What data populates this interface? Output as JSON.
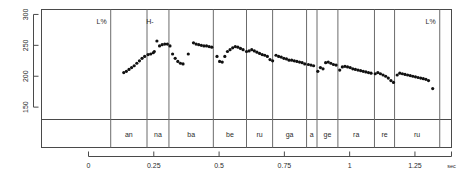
{
  "chart_data": {
    "type": "scatter",
    "title": "",
    "subtitle": "",
    "xlabel": "sec",
    "ylabel": "",
    "xlim": [
      -0.18,
      1.39
    ],
    "ylim": [
      130,
      308
    ],
    "grid": false,
    "legend": null,
    "xticks": [
      0,
      0.25,
      0.5,
      0.75,
      1,
      1.25
    ],
    "xticklabels": [
      "0",
      "0.25",
      "0.5",
      "0.75",
      "1",
      "1.25"
    ],
    "yticks": [
      150,
      200,
      250,
      300
    ],
    "yticklabels": [
      "150",
      "200",
      "250",
      "300"
    ],
    "x_unit_label": "sec",
    "series": [
      {
        "name": "f0",
        "x": [
          0.135,
          0.145,
          0.155,
          0.165,
          0.175,
          0.185,
          0.195,
          0.205,
          0.215,
          0.228,
          0.238,
          0.248,
          0.252,
          0.262,
          0.272,
          0.282,
          0.292,
          0.302,
          0.312,
          0.322,
          0.332,
          0.342,
          0.352,
          0.362,
          0.382,
          0.402,
          0.412,
          0.422,
          0.432,
          0.442,
          0.452,
          0.462,
          0.472,
          0.492,
          0.502,
          0.512,
          0.522,
          0.532,
          0.542,
          0.552,
          0.562,
          0.572,
          0.582,
          0.592,
          0.605,
          0.615,
          0.625,
          0.635,
          0.645,
          0.655,
          0.665,
          0.675,
          0.685,
          0.695,
          0.705,
          0.718,
          0.728,
          0.738,
          0.748,
          0.758,
          0.768,
          0.778,
          0.788,
          0.798,
          0.808,
          0.818,
          0.828,
          0.842,
          0.852,
          0.862,
          0.878,
          0.888,
          0.898,
          0.908,
          0.918,
          0.928,
          0.938,
          0.948,
          0.962,
          0.972,
          0.982,
          0.992,
          1.002,
          1.012,
          1.022,
          1.032,
          1.042,
          1.052,
          1.062,
          1.072,
          1.082,
          1.098,
          1.108,
          1.118,
          1.128,
          1.138,
          1.148,
          1.158,
          1.168,
          1.182,
          1.192,
          1.202,
          1.212,
          1.222,
          1.232,
          1.242,
          1.252,
          1.262,
          1.272,
          1.282,
          1.292,
          1.302,
          1.318
        ],
        "y": [
          206,
          208,
          211,
          214,
          217,
          221,
          225,
          229,
          232,
          235,
          236,
          238,
          240,
          257,
          249,
          251,
          252,
          252,
          249,
          236,
          229,
          224,
          221,
          220,
          236,
          254,
          252,
          251,
          250,
          249,
          249,
          248,
          247,
          232,
          224,
          223,
          232,
          240,
          243,
          246,
          248,
          247,
          245,
          243,
          240,
          241,
          243,
          241,
          239,
          237,
          235,
          234,
          232,
          227,
          225,
          234,
          232,
          231,
          229,
          228,
          226,
          226,
          225,
          224,
          223,
          222,
          220,
          219,
          218,
          217,
          208,
          214,
          212,
          222,
          223,
          221,
          219,
          218,
          210,
          215,
          216,
          215,
          214,
          212,
          211,
          210,
          209,
          208,
          207,
          206,
          205,
          204,
          206,
          204,
          202,
          200,
          197,
          193,
          190,
          202,
          205,
          204,
          203,
          202,
          201,
          200,
          199,
          198,
          197,
          196,
          195,
          193,
          180
        ]
      }
    ],
    "vertical_boundaries": [
      0.085,
      0.224,
      0.308,
      0.478,
      0.605,
      0.705,
      0.835,
      0.875,
      0.955,
      1.095,
      1.172,
      1.345
    ],
    "segment_labels": [
      "an",
      "na",
      "ba",
      "be",
      "ru",
      "ga",
      "a",
      "ge",
      "ra",
      "re",
      "ru"
    ],
    "tone_annotations": [
      {
        "label": "L%",
        "x": 0.085
      },
      {
        "label": "H-",
        "x": 0.265
      },
      {
        "label": "L%",
        "x": 1.345
      }
    ]
  },
  "plot": {
    "unit": "sec"
  }
}
